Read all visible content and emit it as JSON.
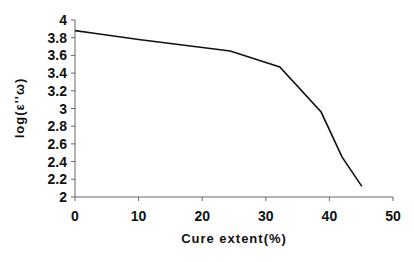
{
  "chart_data": {
    "type": "line",
    "title": "",
    "xlabel": "Cure extent(%)",
    "ylabel": "log(ε''ω)",
    "xlim": [
      0,
      50
    ],
    "ylim": [
      2,
      4
    ],
    "x_ticks": [
      0,
      10,
      20,
      30,
      40,
      50
    ],
    "y_ticks": [
      "4",
      "3.8",
      "3.6",
      "3.4",
      "3.2",
      "3",
      "2.8",
      "2.6",
      "2.4",
      "2.2",
      "2"
    ],
    "grid": false,
    "legend": null,
    "series": [
      {
        "name": "log(ε''ω)",
        "x": [
          0,
          3,
          10,
          24.4,
          32.2,
          38.7,
          42,
          45.1
        ],
        "y": [
          3.88,
          3.85,
          3.78,
          3.65,
          3.47,
          2.96,
          2.45,
          2.12
        ]
      }
    ]
  }
}
